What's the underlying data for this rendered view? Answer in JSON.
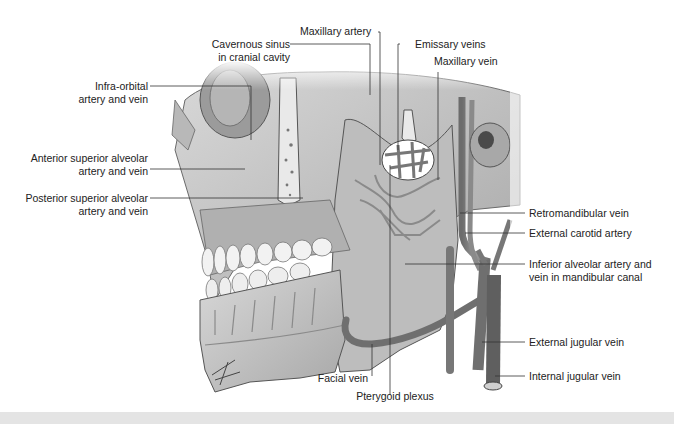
{
  "figure": {
    "labels": {
      "maxillary_artery": "Maxillary artery",
      "cavernous_sinus_l1": "Cavernous sinus",
      "cavernous_sinus_l2": "in cranial cavity",
      "emissary_veins": "Emissary veins",
      "maxillary_vein": "Maxillary vein",
      "infra_orbital_l1": "Infra-orbital",
      "infra_orbital_l2": "artery and vein",
      "anterior_superior_l1": "Anterior superior alveolar",
      "anterior_superior_l2": "artery and vein",
      "posterior_superior_l1": "Posterior superior alveolar",
      "posterior_superior_l2": "artery and vein",
      "retromandibular_vein": "Retromandibular vein",
      "external_carotid_artery": "External carotid artery",
      "inferior_alveolar_l1": "Inferior alveolar artery and",
      "inferior_alveolar_l2": "vein in mandibular canal",
      "external_jugular_vein": "External jugular vein",
      "internal_jugular_vein": "Internal jugular vein",
      "facial_vein": "Facial vein",
      "pterygoid_plexus": "Pterygoid plexus"
    },
    "colors": {
      "bone": "#c9c9c9",
      "bone_dark": "#8e8e8e",
      "vessel": "#7a7a7a",
      "leader_line": "#333333",
      "tooth": "#f2f2f2"
    }
  }
}
